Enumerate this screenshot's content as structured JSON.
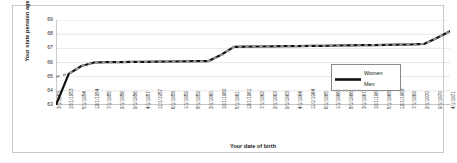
{
  "chart_data": {
    "type": "line",
    "title": "",
    "xlabel": "Your date of birth",
    "ylabel": "Your state pension age",
    "ylim": [
      63,
      69
    ],
    "yticks": [
      63,
      64,
      65,
      66,
      67,
      68,
      69
    ],
    "grid": true,
    "legend_position": "inside-bottom-right",
    "categories": [
      "3/1/1953",
      "10/1/1953",
      "5/1/1954",
      "12/1/1954",
      "7/1/1955",
      "2/1/1956",
      "9/1/1956",
      "4/1/1957",
      "11/1/1957",
      "6/1/1958",
      "1/1/1959",
      "8/1/1959",
      "3/1/1960",
      "10/1/1960",
      "5/1/1961",
      "12/1/1961",
      "7/1/1962",
      "2/1/1963",
      "9/1/1963",
      "4/1/1964",
      "11/1/1964",
      "6/1/1965",
      "1/1/1966",
      "8/1/1966",
      "3/1/1967",
      "10/1/1967",
      "5/1/1968",
      "12/1/1968",
      "7/1/1969",
      "2/1/1970",
      "9/1/1970",
      "4/1/1971"
    ],
    "series": [
      {
        "name": "Women",
        "style": "solid",
        "color": "#111111",
        "values": [
          63.0,
          65.2,
          65.75,
          66.0,
          66.02,
          66.03,
          66.04,
          66.05,
          66.06,
          66.07,
          66.08,
          66.09,
          66.1,
          66.55,
          67.1,
          67.12,
          67.13,
          67.14,
          67.15,
          67.16,
          67.17,
          67.18,
          67.2,
          67.21,
          67.22,
          67.23,
          67.25,
          67.26,
          67.28,
          67.32,
          67.75,
          68.2
        ]
      },
      {
        "name": "Men",
        "style": "dashed",
        "color": "#9a9a9a",
        "values": [
          65.0,
          65.2,
          65.75,
          66.0,
          66.02,
          66.03,
          66.04,
          66.05,
          66.06,
          66.07,
          66.08,
          66.09,
          66.1,
          66.55,
          67.1,
          67.12,
          67.13,
          67.14,
          67.15,
          67.16,
          67.17,
          67.18,
          67.2,
          67.21,
          67.22,
          67.23,
          67.25,
          67.26,
          67.28,
          67.32,
          67.75,
          68.2
        ]
      }
    ]
  },
  "legend": {
    "women_label": "Women",
    "men_label": "Men"
  },
  "axes": {
    "x_title": "Your date of birth",
    "y_title": "Your state pension age"
  }
}
